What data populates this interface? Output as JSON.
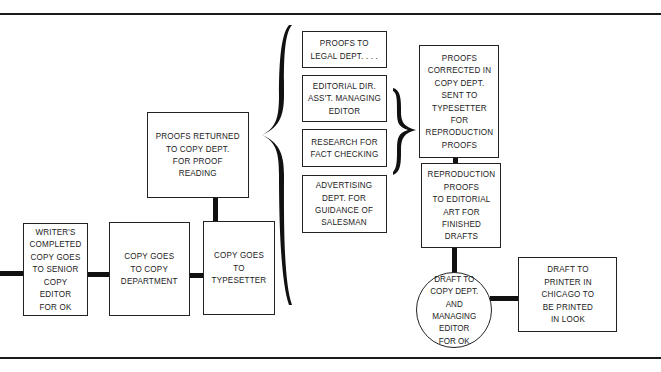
{
  "diagram": {
    "type": "flowchart",
    "nodes": [
      {
        "id": "writer",
        "shape": "rect",
        "label": "WRITER'S\nCOMPLETED\nCOPY GOES\nTO SENIOR\nCOPY EDITOR\nFOR OK"
      },
      {
        "id": "copy_dept",
        "shape": "rect",
        "label": "COPY GOES\nTO COPY\nDEPARTMENT"
      },
      {
        "id": "typesetter",
        "shape": "rect",
        "label": "COPY GOES\nTO TYPESETTER"
      },
      {
        "id": "proofs_returned",
        "shape": "rect",
        "label": "PROOFS RETURNED\nTO COPY DEPT.\nFOR PROOF\nREADING"
      },
      {
        "id": "legal",
        "shape": "rect",
        "label": "PROOFS TO\nLEGAL DEPT. . . ."
      },
      {
        "id": "editorial",
        "shape": "rect",
        "label": "EDITORIAL DIR.\nASS'T. MANAGING\nEDITOR"
      },
      {
        "id": "research",
        "shape": "rect",
        "label": "RESEARCH FOR\nFACT CHECKING"
      },
      {
        "id": "advertising",
        "shape": "rect",
        "label": "ADVERTISING\nDEPT. FOR\nGUIDANCE OF\nSALESMAN"
      },
      {
        "id": "proofs_corrected",
        "shape": "rect",
        "label": "PROOFS\nCORRECTED IN\nCOPY DEPT.\nSENT TO\nTYPESETTER\nFOR\nREPRODUCTION\nPROOFS"
      },
      {
        "id": "reproduction",
        "shape": "rect",
        "label": "REPRODUCTION\nPROOFS\nTO EDITORIAL\nART FOR\nFINISHED\nDRAFTS"
      },
      {
        "id": "draft_copy",
        "shape": "circle",
        "label": "DRAFT TO\nCOPY DEPT.\nAND\nMANAGING\nEDITOR\nFOR OK"
      },
      {
        "id": "printer",
        "shape": "rect",
        "label": "DRAFT TO\nPRINTER IN\nCHICAGO TO\nBE PRINTED\nIN LOOK"
      }
    ],
    "edges": [
      {
        "from": "writer",
        "to": "copy_dept"
      },
      {
        "from": "copy_dept",
        "to": "typesetter"
      },
      {
        "from": "typesetter",
        "to": "proofs_returned"
      },
      {
        "from": "proofs_returned",
        "to": [
          "legal",
          "editorial",
          "research",
          "advertising"
        ],
        "style": "brace"
      },
      {
        "from": [
          "editorial",
          "research"
        ],
        "to": "proofs_corrected",
        "style": "brace"
      },
      {
        "from": "proofs_corrected",
        "to": "reproduction"
      },
      {
        "from": "reproduction",
        "to": "draft_copy"
      },
      {
        "from": "draft_copy",
        "to": "printer"
      }
    ],
    "colors": {
      "ink": "#222222",
      "background": "#ffffff"
    }
  }
}
